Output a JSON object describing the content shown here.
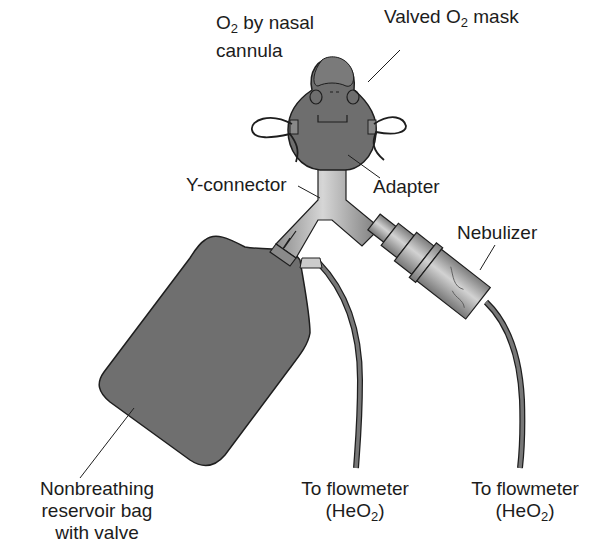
{
  "diagram": {
    "labels": {
      "nasal_cannula": {
        "line1_pre": "O",
        "line1_sub": "2",
        "line1_post": " by nasal",
        "line2": "cannula"
      },
      "valved_mask": {
        "pre": "Valved O",
        "sub": "2",
        "post": " mask"
      },
      "y_connector": "Y-connector",
      "adapter": "Adapter",
      "nebulizer": "Nebulizer",
      "reservoir_bag": {
        "line1": "Nonbreathing",
        "line2": "reservoir bag",
        "line3": "with valve"
      },
      "flowmeter_left": {
        "line1": "To flowmeter",
        "line2_pre": "(HeO",
        "line2_sub": "2",
        "line2_post": ")"
      },
      "flowmeter_right": {
        "line1": "To flowmeter",
        "line2_pre": "(HeO",
        "line2_sub": "2",
        "line2_post": ")"
      }
    },
    "components": [
      "face-mask",
      "nasal-cannula",
      "adapter",
      "y-connector",
      "nebulizer",
      "reservoir-bag",
      "flowmeter-tube-left",
      "flowmeter-tube-right"
    ],
    "colors": {
      "fill_dark": "#6e6e6e",
      "fill_mid": "#8a8a8a",
      "fill_light": "#c8c8c8",
      "stroke": "#1e1e1e",
      "text": "#1c1c1c"
    }
  }
}
